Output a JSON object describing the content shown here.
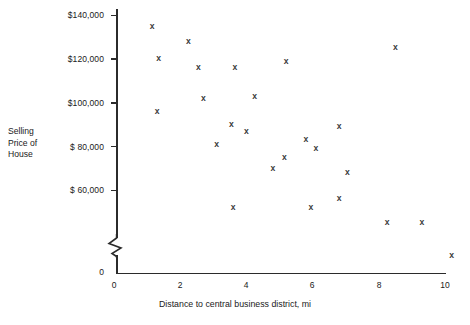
{
  "chart_data": {
    "type": "scatter",
    "title": "",
    "xlabel": "Distance to central business district, mi",
    "ylabel": "Selling Price of House",
    "ylabel_lines": [
      "Selling",
      "Price of",
      "House"
    ],
    "xlim": [
      0,
      10
    ],
    "ylim": [
      0,
      140000
    ],
    "y_axis_break": true,
    "y_axis_break_note": "axis broken between 0 and $60,000 region",
    "grid": false,
    "legend": null,
    "marker": "x",
    "marker_color": "#3a3a3a",
    "xticks": [
      0,
      2,
      4,
      6,
      8,
      10
    ],
    "xtick_labels": [
      "0",
      "2",
      "4",
      "6",
      "8",
      "10"
    ],
    "yticks": [
      0,
      60000,
      80000,
      100000,
      120000,
      140000
    ],
    "ytick_labels": [
      "0",
      "$ 60,000",
      "$ 80,000",
      "$100,000",
      "$120,000",
      "$140,000"
    ],
    "points": [
      {
        "x": 1.15,
        "y": 135000
      },
      {
        "x": 2.25,
        "y": 128000
      },
      {
        "x": 1.35,
        "y": 120000
      },
      {
        "x": 2.55,
        "y": 116000
      },
      {
        "x": 3.65,
        "y": 116000
      },
      {
        "x": 5.2,
        "y": 119000
      },
      {
        "x": 8.5,
        "y": 125000
      },
      {
        "x": 2.7,
        "y": 102000
      },
      {
        "x": 4.25,
        "y": 103000
      },
      {
        "x": 1.3,
        "y": 96000
      },
      {
        "x": 3.55,
        "y": 90000
      },
      {
        "x": 4.0,
        "y": 87000
      },
      {
        "x": 5.8,
        "y": 83000
      },
      {
        "x": 6.8,
        "y": 89000
      },
      {
        "x": 3.1,
        "y": 81000
      },
      {
        "x": 5.15,
        "y": 75000
      },
      {
        "x": 6.1,
        "y": 79000
      },
      {
        "x": 4.8,
        "y": 70000
      },
      {
        "x": 7.05,
        "y": 68000
      },
      {
        "x": 3.6,
        "y": 52000
      },
      {
        "x": 5.95,
        "y": 52000
      },
      {
        "x": 6.8,
        "y": 56000
      },
      {
        "x": 8.25,
        "y": 45000
      },
      {
        "x": 9.3,
        "y": 45000
      },
      {
        "x": 10.2,
        "y": 30000
      }
    ]
  },
  "axis": {
    "x_title": "Distance to central business district, mi",
    "y_title_line1": "Selling",
    "y_title_line2": "Price of",
    "y_title_line3": "House",
    "x_tick_0": "0",
    "x_tick_2": "2",
    "x_tick_4": "4",
    "x_tick_6": "6",
    "x_tick_8": "8",
    "x_tick_10": "10",
    "y_tick_140k": "$140,000",
    "y_tick_120k": "$120,000",
    "y_tick_100k": "$100,000",
    "y_tick_80k": "$ 80,000",
    "y_tick_60k": "$ 60,000",
    "y_tick_0": "0"
  },
  "colors": {
    "axis": "#2b2b2b",
    "text": "#1a1a1a",
    "marker": "#3a3a3a",
    "background": "#ffffff"
  }
}
